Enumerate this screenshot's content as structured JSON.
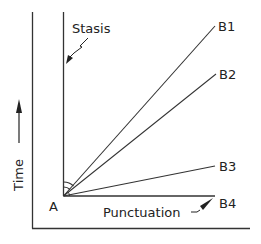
{
  "diagram": {
    "origin_label": "A",
    "stasis_label": "Stasis",
    "punctuation_label": "Punctuation",
    "y_axis_label": "Time",
    "branches": [
      {
        "label": "B1"
      },
      {
        "label": "B2"
      },
      {
        "label": "B3"
      },
      {
        "label": "B4"
      }
    ],
    "colors": {
      "line": "#333333",
      "text": "#222222",
      "background": "#ffffff"
    }
  }
}
